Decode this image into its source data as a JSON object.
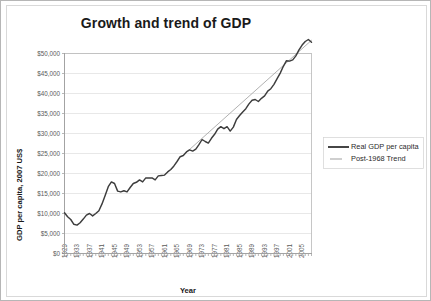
{
  "chart_data": {
    "type": "line",
    "title": "Growth and trend of GDP",
    "xlabel": "Year",
    "ylabel": "GDP per capita, 2007 US$",
    "xlim": [
      1929,
      2008
    ],
    "ylim": [
      0,
      50000
    ],
    "grid": true,
    "legend_position": "right",
    "y_ticks": [
      "$0",
      "$5,000",
      "$10,000",
      "$15,000",
      "$20,000",
      "$25,000",
      "$30,000",
      "$35,000",
      "$40,000",
      "$45,000",
      "$50,000"
    ],
    "y_tick_values": [
      0,
      5000,
      10000,
      15000,
      20000,
      25000,
      30000,
      35000,
      40000,
      45000,
      50000
    ],
    "x_ticks": [
      "1929",
      "1933",
      "1937",
      "1941",
      "1945",
      "1949",
      "1953",
      "1957",
      "1961",
      "1965",
      "1969",
      "1973",
      "1977",
      "1981",
      "1985",
      "1989",
      "1993",
      "1997",
      "2001",
      "2005"
    ],
    "x_tick_values": [
      1929,
      1933,
      1937,
      1941,
      1945,
      1949,
      1953,
      1957,
      1961,
      1965,
      1969,
      1973,
      1977,
      1981,
      1985,
      1989,
      1993,
      1997,
      2001,
      2005
    ],
    "series": [
      {
        "name": "Real GDP per capita",
        "color": "#3d3d3d",
        "x": [
          1929,
          1930,
          1931,
          1932,
          1933,
          1934,
          1935,
          1936,
          1937,
          1938,
          1939,
          1940,
          1941,
          1942,
          1943,
          1944,
          1945,
          1946,
          1947,
          1948,
          1949,
          1950,
          1951,
          1952,
          1953,
          1954,
          1955,
          1956,
          1957,
          1958,
          1959,
          1960,
          1961,
          1962,
          1963,
          1964,
          1965,
          1966,
          1967,
          1968,
          1969,
          1970,
          1971,
          1972,
          1973,
          1974,
          1975,
          1976,
          1977,
          1978,
          1979,
          1980,
          1981,
          1982,
          1983,
          1984,
          1985,
          1986,
          1987,
          1988,
          1989,
          1990,
          1991,
          1992,
          1993,
          1994,
          1995,
          1996,
          1997,
          1998,
          1999,
          2000,
          2001,
          2002,
          2003,
          2004,
          2005,
          2006,
          2007,
          2008
        ],
        "values": [
          10200,
          9200,
          8500,
          7300,
          7100,
          7700,
          8600,
          9600,
          10000,
          9400,
          10000,
          10700,
          12400,
          14500,
          16700,
          17900,
          17500,
          15600,
          15400,
          15700,
          15400,
          16500,
          17500,
          17800,
          18400,
          17900,
          18900,
          18900,
          18900,
          18400,
          19400,
          19500,
          19600,
          20400,
          21000,
          21900,
          23000,
          24200,
          24500,
          25400,
          25900,
          25600,
          26100,
          27200,
          28500,
          28000,
          27600,
          28800,
          29800,
          31100,
          31700,
          31200,
          31700,
          30600,
          31600,
          33500,
          34500,
          35400,
          36200,
          37400,
          38300,
          38500,
          38000,
          38800,
          39400,
          40600,
          41200,
          42300,
          43700,
          45100,
          46800,
          48200,
          48100,
          48400,
          49400,
          50900,
          52100,
          53000,
          53500,
          52800
        ]
      },
      {
        "name": "Post-1968 Trend",
        "color": "#a8a8a8",
        "x": [
          1968,
          2008
        ],
        "values": [
          25300,
          53300
        ]
      }
    ],
    "note": "Real GDP per capita shows Depression trough near $7,000 in 1933, WWII peak near $18,700 in 1944, with steady postwar growth reaching about $45,500 by 2007."
  },
  "legend": {
    "entries": [
      {
        "label": "Real GDP per capita",
        "style": "thick-dark-line"
      },
      {
        "label": "Post-1968 Trend",
        "style": "thin-gray-line"
      }
    ]
  }
}
